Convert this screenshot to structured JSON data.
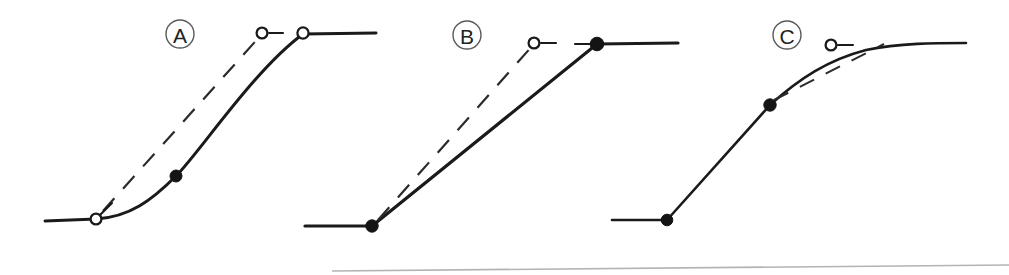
{
  "figure": {
    "width": 1009,
    "height": 275,
    "background_color": "#ffffff",
    "line_color": "#1a1a1a",
    "label_ring_color": "#5a5a5a",
    "artifact_color": "#9a9a9a"
  },
  "panels": [
    {
      "id": "A",
      "label": "A",
      "label_center": {
        "x": 180,
        "y": 34
      },
      "label_radius": 14,
      "curve_kind": "S-curve with flat left shelf and flat right plateau",
      "solid_path": "M 45 221 L 96 219 C 130 217 152 200 176 176 C 200 152 254 70 303 34 L 376 33",
      "dashed_path": "M 103 211 L 262 34",
      "dash_pattern": "17 13",
      "markers": [
        {
          "type": "open",
          "x": 96,
          "y": 219,
          "radius": 5.4,
          "stub": {
            "x1": 100,
            "y1": 215,
            "x2": 112,
            "y2": 203
          }
        },
        {
          "type": "filled",
          "x": 176,
          "y": 176,
          "radius": 6.0,
          "stub": null
        },
        {
          "type": "open",
          "x": 262,
          "y": 33,
          "radius": 5.4,
          "stub": {
            "x1": 269,
            "y1": 33,
            "x2": 283,
            "y2": 33
          }
        },
        {
          "type": "open",
          "x": 303,
          "y": 33,
          "radius": 5.6,
          "stub": null
        }
      ],
      "stroke_width_solid": 3.0,
      "stroke_width_dashed": 2.2
    },
    {
      "id": "B",
      "label": "B",
      "label_center": {
        "x": 467,
        "y": 35
      },
      "label_radius": 14,
      "curve_kind": "piecewise-linear ramp between two flat shelves",
      "solid_path": "M 305 226 L 372 226 L 597 44 L 678 43",
      "dashed_path": "M 378 220 L 534 44",
      "dash_pattern": "17 13",
      "markers": [
        {
          "type": "filled",
          "x": 372,
          "y": 226,
          "radius": 6.2,
          "stub": null
        },
        {
          "type": "open",
          "x": 534,
          "y": 43,
          "radius": 5.4,
          "stub": {
            "x1": 541,
            "y1": 43,
            "x2": 556,
            "y2": 43
          }
        },
        {
          "type": "filled",
          "x": 597,
          "y": 44,
          "radius": 6.8,
          "stub": {
            "x1": 575,
            "y1": 44,
            "x2": 597,
            "y2": 44
          }
        }
      ],
      "stroke_width_solid": 3.2,
      "stroke_width_dashed": 2.2
    },
    {
      "id": "C",
      "label": "C",
      "label_center": {
        "x": 787,
        "y": 35
      },
      "label_radius": 14,
      "curve_kind": "concave saturating curve from a flat shelf to an asymptote",
      "solid_path": "M 612 220 L 667 220 L 770 105 C 800 78 828 60 866 50 C 900 43 935 43 966 43",
      "dashed_path": "M 774 100 L 884 44",
      "dash_pattern": "16 13",
      "markers": [
        {
          "type": "filled",
          "x": 667,
          "y": 220,
          "radius": 5.8,
          "stub": null
        },
        {
          "type": "filled",
          "x": 770,
          "y": 105,
          "radius": 6.2,
          "stub": null
        },
        {
          "type": "open",
          "x": 831,
          "y": 45,
          "radius": 5.4,
          "stub": {
            "x1": 838,
            "y1": 45,
            "x2": 853,
            "y2": 45
          }
        }
      ],
      "stroke_width_solid": 2.6,
      "stroke_width_dashed": 2.0
    }
  ],
  "artifacts": [
    {
      "name": "scan-baseline-streak",
      "path": "M 332 271 L 1009 265"
    }
  ]
}
